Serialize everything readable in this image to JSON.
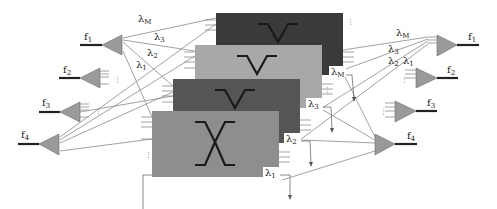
{
  "diagram": {
    "type": "wavelength-switch-planes",
    "input_fibers": [
      {
        "label": "f",
        "sub": "1"
      },
      {
        "label": "f",
        "sub": "2"
      },
      {
        "label": "f",
        "sub": "3"
      },
      {
        "label": "f",
        "sub": "4"
      }
    ],
    "output_fibers": [
      {
        "label": "f",
        "sub": "1"
      },
      {
        "label": "f",
        "sub": "2"
      },
      {
        "label": "f",
        "sub": "3"
      },
      {
        "label": "f",
        "sub": "4"
      }
    ],
    "input_wavelength_labels": [
      {
        "label": "λ",
        "sub": "M"
      },
      {
        "label": "λ",
        "sub": "3"
      },
      {
        "label": "λ",
        "sub": "2"
      },
      {
        "label": "λ",
        "sub": "1"
      }
    ],
    "output_wavelength_labels": [
      {
        "label": "λ",
        "sub": "M"
      },
      {
        "label": "λ",
        "sub": "3"
      },
      {
        "label": "λ",
        "sub": "2"
      },
      {
        "label": "λ",
        "sub": "1"
      }
    ],
    "switch_planes": [
      {
        "tag": "λ",
        "sub": "M",
        "color": "#3a3a3a",
        "state": "bar"
      },
      {
        "tag": "λ",
        "sub": "3",
        "color": "#a8a8a8",
        "state": "bar"
      },
      {
        "tag": "λ",
        "sub": "2",
        "color": "#555555",
        "state": "bar"
      },
      {
        "tag": "λ",
        "sub": "1",
        "color": "#8e8e8e",
        "state": "cross"
      }
    ],
    "ellipsis": "⋮"
  }
}
